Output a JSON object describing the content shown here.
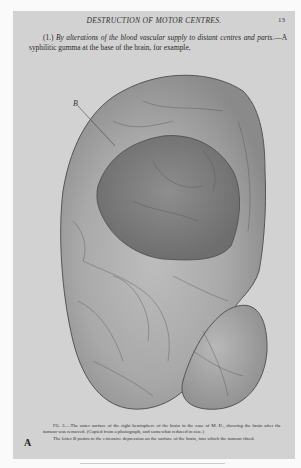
{
  "page": {
    "running_head": "DESTRUCTION OF MOTOR CENTRES.",
    "page_number": "13",
    "paragraph": {
      "lead": "(1.)",
      "italic_heading": "By alterations of the blood vascular supply to distant centres and parts.",
      "text": "—A syphilitic gumma at the base of the brain, for example,"
    },
    "figure": {
      "label_B": "B",
      "description": "Engraving of outer surface of right hemisphere of brain showing tumour depression"
    },
    "caption": {
      "fig_label": "Fig. 3.",
      "line1": "—The outer surface of the right hemisphere of the brain in the case of M. D., showing the brain after the tumour was removed.  (Copied from a photograph, and somewhat reduced in size.)",
      "line2": "The letter B points to the extensive depression on the surface of the brain, into which the tumour fitted."
    },
    "plate_letter": "A"
  },
  "colors": {
    "page_bg": "#d2d2d2",
    "outer_bg": "#fafafa",
    "ink": "#2a2a2a"
  }
}
